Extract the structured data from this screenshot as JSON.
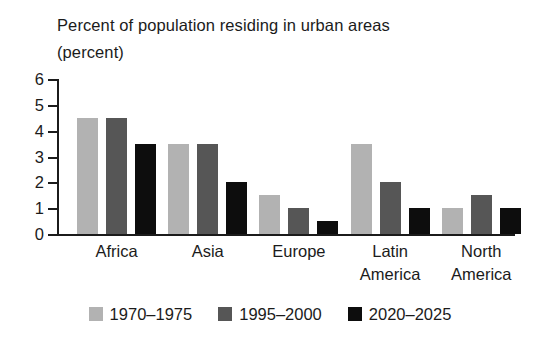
{
  "chart_data": {
    "type": "bar",
    "title": "Percent of population residing in urban areas",
    "subtitle": "(percent)",
    "xlabel": "",
    "ylabel": "",
    "ylim": [
      0,
      6
    ],
    "yticks": [
      0,
      1,
      2,
      3,
      4,
      5,
      6
    ],
    "ytick_labels": [
      "0",
      "1",
      "2",
      "3",
      "4",
      "5",
      "6"
    ],
    "grid": false,
    "legend_position": "bottom",
    "categories": [
      "Africa",
      "Asia",
      "Europe",
      "Latin America",
      "North America"
    ],
    "category_lines": [
      [
        "Africa"
      ],
      [
        "Asia"
      ],
      [
        "Europe"
      ],
      [
        "Latin",
        "America"
      ],
      [
        "North",
        "America"
      ]
    ],
    "series": [
      {
        "name": "1970–1975",
        "color": "#b2b2b2",
        "values": [
          4.5,
          3.5,
          1.5,
          3.5,
          1.0
        ]
      },
      {
        "name": "1995–2000",
        "color": "#565656",
        "values": [
          4.5,
          3.5,
          1.0,
          2.0,
          1.5
        ]
      },
      {
        "name": "2020–2025",
        "color": "#0d0d0d",
        "values": [
          3.5,
          2.0,
          0.5,
          1.0,
          1.0
        ]
      }
    ]
  }
}
